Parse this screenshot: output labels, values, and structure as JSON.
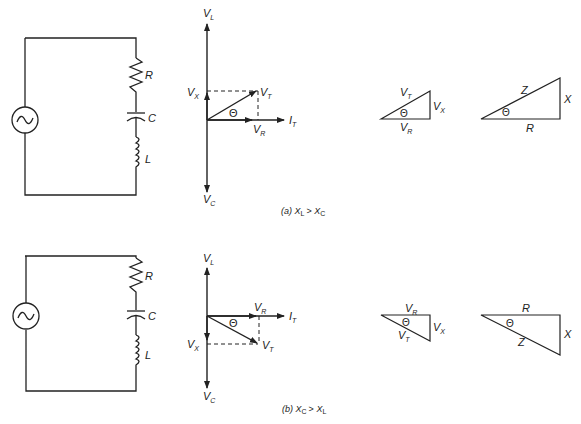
{
  "diagram": {
    "panels": [
      {
        "id": "a",
        "caption": {
          "prefix": "(a)",
          "lhs": "X",
          "lhs_sub": "L",
          "op": ">",
          "rhs": "X",
          "rhs_sub": "C"
        },
        "circuit": {
          "components": [
            {
              "label": "R"
            },
            {
              "label": "C"
            },
            {
              "label": "L"
            }
          ],
          "source": "ac-source"
        },
        "phasor": {
          "vl": {
            "main": "V",
            "sub": "L"
          },
          "vc": {
            "main": "V",
            "sub": "C"
          },
          "vx": {
            "main": "V",
            "sub": "X"
          },
          "vt": {
            "main": "V",
            "sub": "T"
          },
          "vr": {
            "main": "V",
            "sub": "R"
          },
          "it": {
            "main": "I",
            "sub": "T"
          },
          "theta": "Θ"
        },
        "voltage_triangle": {
          "hyp": {
            "main": "V",
            "sub": "T"
          },
          "opp": {
            "main": "V",
            "sub": "X"
          },
          "adj": {
            "main": "V",
            "sub": "R"
          },
          "theta": "Θ"
        },
        "impedance_triangle": {
          "hyp": "Z",
          "opp": "X",
          "adj": "R",
          "theta": "Θ"
        }
      },
      {
        "id": "b",
        "caption": {
          "prefix": "(b)",
          "lhs": "X",
          "lhs_sub": "C",
          "op": ">",
          "rhs": "X",
          "rhs_sub": "L"
        },
        "circuit": {
          "components": [
            {
              "label": "R"
            },
            {
              "label": "C"
            },
            {
              "label": "L"
            }
          ],
          "source": "ac-source"
        },
        "phasor": {
          "vl": {
            "main": "V",
            "sub": "L"
          },
          "vc": {
            "main": "V",
            "sub": "C"
          },
          "vx": {
            "main": "V",
            "sub": "X"
          },
          "vt": {
            "main": "V",
            "sub": "T"
          },
          "vr": {
            "main": "V",
            "sub": "R"
          },
          "it": {
            "main": "I",
            "sub": "T"
          },
          "theta": "Θ"
        },
        "voltage_triangle": {
          "hyp": {
            "main": "V",
            "sub": "T"
          },
          "opp": {
            "main": "V",
            "sub": "X"
          },
          "adj": {
            "main": "V",
            "sub": "R"
          },
          "theta": "Θ"
        },
        "impedance_triangle": {
          "hyp": "Z",
          "opp": "X",
          "adj": "R",
          "theta": "Θ"
        }
      }
    ]
  }
}
